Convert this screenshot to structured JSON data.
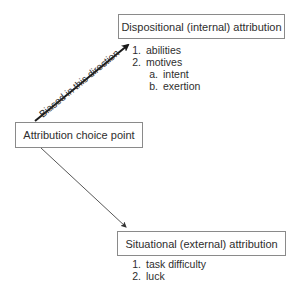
{
  "diagram": {
    "nodes": {
      "dispositional": {
        "label": "Dispositional (internal) attribution",
        "items": [
          {
            "num": "1.",
            "text": "abilities"
          },
          {
            "num": "2.",
            "text": "motives",
            "subitems": [
              {
                "num": "a.",
                "text": "intent"
              },
              {
                "num": "b.",
                "text": "exertion"
              }
            ]
          }
        ]
      },
      "choice_point": {
        "label": "Attribution choice point"
      },
      "situational": {
        "label": "Situational (external) attribution",
        "items": [
          {
            "num": "1.",
            "text": "task difficulty"
          },
          {
            "num": "2.",
            "text": "luck"
          }
        ]
      }
    },
    "edges": [
      {
        "from": "choice_point",
        "to": "dispositional",
        "label": "Biased in this direction",
        "style": "bold"
      },
      {
        "from": "choice_point",
        "to": "situational",
        "label": "",
        "style": "thin"
      }
    ]
  }
}
